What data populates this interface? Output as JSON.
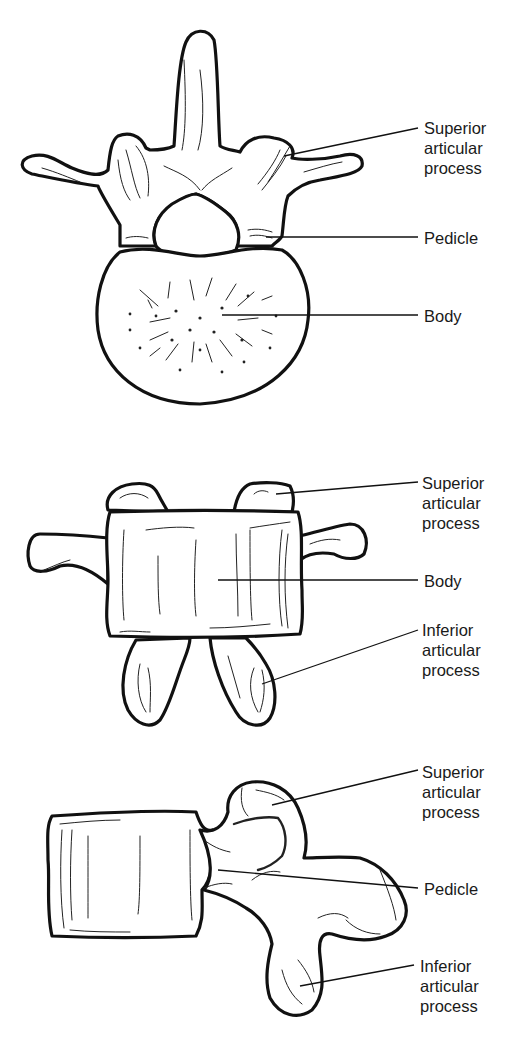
{
  "diagram": {
    "views": [
      {
        "id": "superior",
        "labels": [
          {
            "key": "sap",
            "text": "Superior\narticular\nprocess"
          },
          {
            "key": "pedicle",
            "text": "Pedicle"
          },
          {
            "key": "body",
            "text": "Body"
          }
        ]
      },
      {
        "id": "posterior",
        "labels": [
          {
            "key": "sap",
            "text": "Superior\narticular\nprocess"
          },
          {
            "key": "body",
            "text": "Body"
          },
          {
            "key": "iap",
            "text": "Inferior\narticular\nprocess"
          }
        ]
      },
      {
        "id": "lateral",
        "labels": [
          {
            "key": "sap",
            "text": "Superior\narticular\nprocess"
          },
          {
            "key": "pedicle",
            "text": "Pedicle"
          },
          {
            "key": "iap",
            "text": "Inferior\narticular\nprocess"
          }
        ]
      }
    ]
  }
}
